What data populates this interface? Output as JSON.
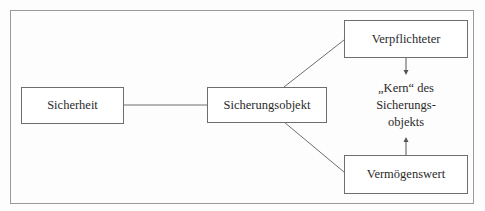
{
  "diagram": {
    "nodes": {
      "sicherheit": "Sicherheit",
      "sicherungsobjekt": "Sicherungsobjekt",
      "verpflichteter": "Verpflichteter",
      "vermoegenswert": "Vermögenswert"
    },
    "core": {
      "line1": "„Kern“ des",
      "line2": "Sicherungs-",
      "line3": "objekts"
    },
    "edges": [
      {
        "from": "Sicherheit",
        "to": "Sicherungsobjekt",
        "type": "line"
      },
      {
        "from": "Sicherungsobjekt",
        "to": "Verpflichteter",
        "type": "line"
      },
      {
        "from": "Sicherungsobjekt",
        "to": "Vermögenswert",
        "type": "line"
      },
      {
        "from": "Verpflichteter",
        "to": "„Kern“ des Sicherungsobjekts",
        "type": "arrow"
      },
      {
        "from": "Vermögenswert",
        "to": "„Kern“ des Sicherungsobjekts",
        "type": "arrow"
      }
    ]
  }
}
